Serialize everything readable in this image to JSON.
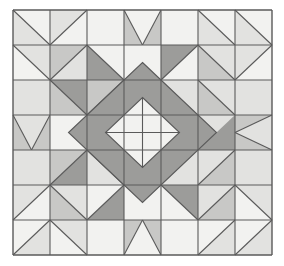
{
  "artwork": {
    "title": "Quilt Block Pattern",
    "description": "Symmetric seven-by-seven patchwork quilt block with central diamond medallion",
    "type": "quilt-block-diagram"
  },
  "canvas": {
    "width": 284,
    "height": 266,
    "background": "#ffffff"
  },
  "grid": {
    "columns": 7,
    "rows": 7,
    "origin_x": 13,
    "origin_y": 10,
    "cell_width": 37,
    "cell_height": 35,
    "line_color": "#5a5a5a",
    "line_width": 1.1,
    "outer_border_color": "#5a5a5a",
    "outer_border_width": 1.4
  },
  "palette": {
    "white": "#f2f2f0",
    "light": "#e2e2e0",
    "medium": "#c8c8c6",
    "dark": "#9c9c9a",
    "outline": "#5a5a5a",
    "page_background": "#ffffff"
  },
  "legend": {
    "white_label": "White",
    "light_label": "Light Gray",
    "medium_label": "Medium Gray",
    "dark_label": "Dark Gray"
  },
  "cells": [
    [
      {
        "pattern": "hst",
        "diagonal": "tlbr",
        "a": "light",
        "b": "white"
      },
      {
        "pattern": "hst",
        "diagonal": "trbl",
        "a": "white",
        "b": "light"
      },
      {
        "pattern": "solid",
        "a": "white"
      },
      {
        "pattern": "vflag",
        "a": "medium",
        "b": "white"
      },
      {
        "pattern": "solid",
        "a": "white"
      },
      {
        "pattern": "hst",
        "diagonal": "tlbr",
        "a": "light",
        "b": "white"
      },
      {
        "pattern": "hst",
        "diagonal": "tlbr",
        "a": "light",
        "b": "white"
      }
    ],
    [
      {
        "pattern": "hst",
        "diagonal": "tlbr",
        "a": "white",
        "b": "light"
      },
      {
        "pattern": "hst",
        "diagonal": "trbl",
        "a": "light",
        "b": "medium"
      },
      {
        "pattern": "hst",
        "diagonal": "tlbr",
        "a": "dark",
        "b": "white"
      },
      {
        "pattern": "solid",
        "a": "white"
      },
      {
        "pattern": "hst",
        "diagonal": "trbl",
        "a": "white",
        "b": "dark"
      },
      {
        "pattern": "hst",
        "diagonal": "tlbr",
        "a": "medium",
        "b": "light"
      },
      {
        "pattern": "hst",
        "diagonal": "trbl",
        "a": "white",
        "b": "light"
      }
    ],
    [
      {
        "pattern": "solid",
        "a": "light"
      },
      {
        "pattern": "hst",
        "diagonal": "tlbr",
        "a": "medium",
        "b": "dark"
      },
      {
        "pattern": "hst",
        "diagonal": "trbl",
        "a": "light",
        "b": "medium"
      },
      {
        "pattern": "corner",
        "corner": "br",
        "a": "medium",
        "b": "light"
      },
      {
        "pattern": "corner",
        "corner": "bl",
        "a": "medium",
        "b": "light"
      },
      {
        "pattern": "hst",
        "diagonal": "tlbr",
        "a": "medium",
        "b": "light"
      },
      {
        "pattern": "solid",
        "a": "light"
      }
    ],
    [
      {
        "pattern": "vflag",
        "a": "medium",
        "b": "light"
      },
      {
        "pattern": "solid",
        "a": "white"
      },
      {
        "pattern": "corner",
        "corner": "tr",
        "a": "light",
        "b": "dark"
      },
      {
        "pattern": "center_left",
        "a": "light",
        "b": "white"
      },
      {
        "pattern": "center_right",
        "a": "light",
        "b": "white"
      },
      {
        "pattern": "corner",
        "corner": "tl",
        "a": "light",
        "b": "dark"
      },
      {
        "pattern": "vflag_left",
        "a": "medium",
        "b": "light"
      }
    ],
    [
      {
        "pattern": "solid",
        "a": "light"
      },
      {
        "pattern": "hst",
        "diagonal": "trbl",
        "a": "dark",
        "b": "medium"
      },
      {
        "pattern": "hst",
        "diagonal": "tlbr",
        "a": "light",
        "b": "medium"
      },
      {
        "pattern": "corner",
        "corner": "tr",
        "a": "medium",
        "b": "light"
      },
      {
        "pattern": "corner",
        "corner": "tl",
        "a": "medium",
        "b": "light"
      },
      {
        "pattern": "hst",
        "diagonal": "trbl",
        "a": "medium",
        "b": "light"
      },
      {
        "pattern": "solid",
        "a": "light"
      }
    ],
    [
      {
        "pattern": "hst",
        "diagonal": "trbl",
        "a": "white",
        "b": "light"
      },
      {
        "pattern": "hst",
        "diagonal": "tlbr",
        "a": "medium",
        "b": "light"
      },
      {
        "pattern": "hst",
        "diagonal": "trbl",
        "a": "dark",
        "b": "white"
      },
      {
        "pattern": "solid",
        "a": "white"
      },
      {
        "pattern": "hst",
        "diagonal": "tlbr",
        "a": "white",
        "b": "dark"
      },
      {
        "pattern": "hst",
        "diagonal": "trbl",
        "a": "medium",
        "b": "light"
      },
      {
        "pattern": "hst",
        "diagonal": "tlbr",
        "a": "white",
        "b": "light"
      }
    ],
    [
      {
        "pattern": "hst",
        "diagonal": "trbl",
        "a": "light",
        "b": "white"
      },
      {
        "pattern": "hst",
        "diagonal": "tlbr",
        "a": "white",
        "b": "light"
      },
      {
        "pattern": "solid",
        "a": "white"
      },
      {
        "pattern": "vflag_up",
        "a": "medium",
        "b": "white"
      },
      {
        "pattern": "solid",
        "a": "white"
      },
      {
        "pattern": "hst",
        "diagonal": "trbl",
        "a": "light",
        "b": "white"
      },
      {
        "pattern": "hst",
        "diagonal": "trbl",
        "a": "light",
        "b": "white"
      }
    ]
  ],
  "center_medallion": {
    "description": "Dark gray on-point square spanning the four central cells with a white diamond at its core divided into four triangles by a cross",
    "diamond_color": "dark",
    "inner_diamond_color": "white",
    "inner_cross_color": "outline",
    "outer_half_width_cells": 2,
    "inner_half_width_cells": 1
  }
}
